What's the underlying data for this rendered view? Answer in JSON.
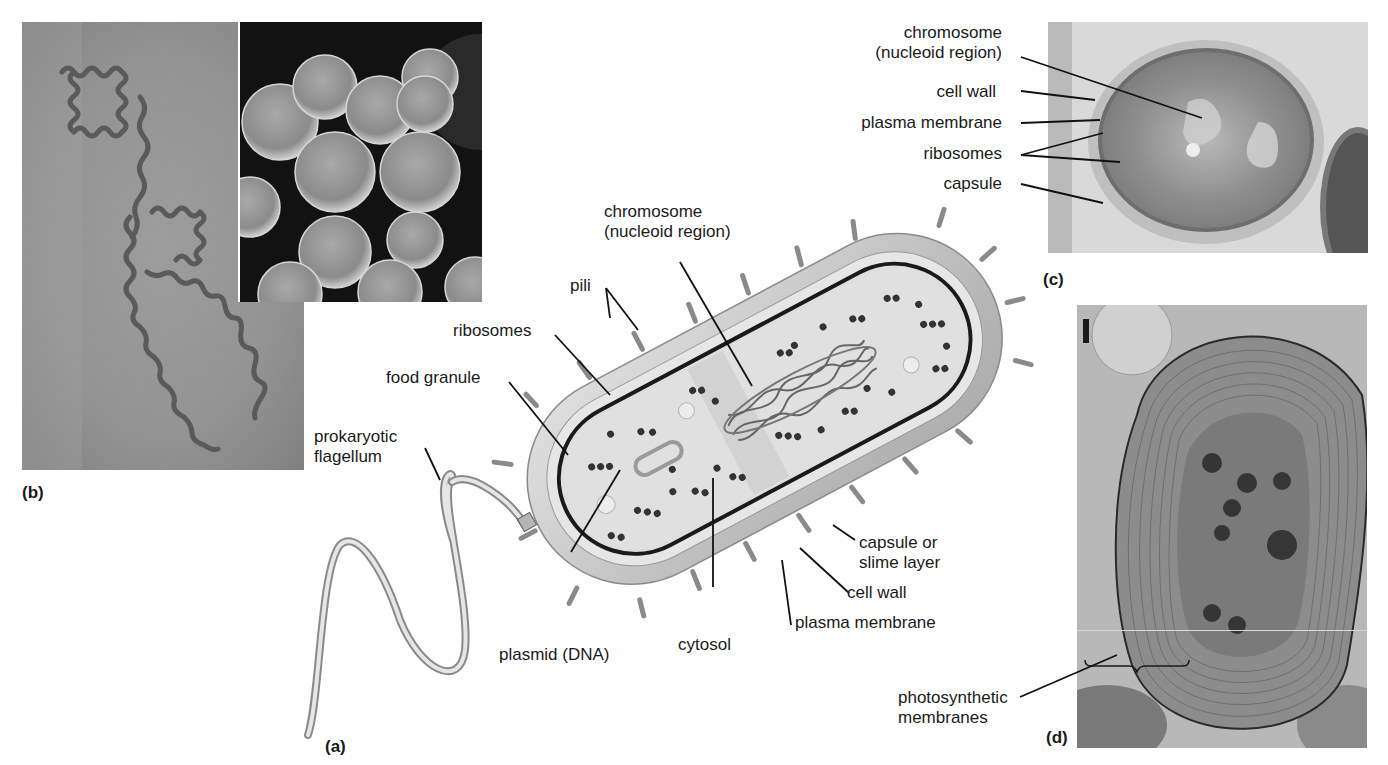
{
  "figure": {
    "panels": {
      "a": {
        "tag": "(a)",
        "description": "cutaway illustration of a rod-shaped prokaryotic cell",
        "labels": {
          "chromosome": "chromosome",
          "chromosome_sub": "(nucleoid region)",
          "pili": "pili",
          "ribosomes": "ribosomes",
          "food_granule": "food granule",
          "flagellum_line1": "prokaryotic",
          "flagellum_line2": "flagellum",
          "plasmid": "plasmid (DNA)",
          "cytosol": "cytosol",
          "plasma_membrane": "plasma membrane",
          "cell_wall": "cell wall",
          "capsule_line1": "capsule or",
          "capsule_line2": "slime layer"
        }
      },
      "b": {
        "tag": "(b)",
        "description": "micrographs: spiral spirochete bacterium and spherical cocci (inset)"
      },
      "c": {
        "tag": "(c)",
        "description": "electron micrograph cross-section of bacterial cell",
        "labels": {
          "chromosome": "chromosome",
          "chromosome_sub": "(nucleoid region)",
          "cell_wall": "cell wall",
          "plasma_membrane": "plasma membrane",
          "ribosomes": "ribosomes",
          "capsule": "capsule"
        }
      },
      "d": {
        "tag": "(d)",
        "description": "electron micrograph of cyanobacterium with concentric photosynthetic membranes",
        "labels": {
          "photosynthetic_line1": "photosynthetic",
          "photosynthetic_line2": "membranes"
        }
      }
    },
    "colors": {
      "background": "#ffffff",
      "text": "#1a1a1a",
      "leader_line": "#111111",
      "capsule_fill": "#c9c9c9",
      "cytosol_fill": "#e2e2e2",
      "ribosome": "#3a3a3a",
      "photo_dark": "#1e1e1e",
      "photo_mid": "#8a8a8a"
    }
  }
}
